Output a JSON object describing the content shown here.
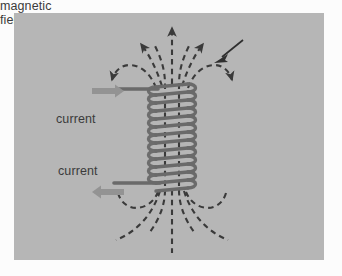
{
  "figure": {
    "background_color": "#b6b6b6",
    "page_color": "#fcfcfc",
    "ink_color": "#6a6a6a",
    "text_color": "#3b3b3b",
    "arrow_color": "#8e8e8e",
    "dash_color": "#3a3a3a"
  },
  "labels": {
    "current_top": "current",
    "current_bottom": "current",
    "field_lines_line1": "magnetic",
    "field_lines_line2": "field lines"
  },
  "components": {
    "solenoid": {
      "name": "helical coil",
      "turns": 13,
      "left": 152,
      "right": 192,
      "top": 84,
      "bottom": 190
    },
    "lead_top": {
      "y": 89,
      "from_x": 118,
      "to_x": 156
    },
    "lead_bottom": {
      "y": 183,
      "from_x": 114,
      "to_x": 158
    },
    "current_arrow_top": {
      "direction": "right",
      "x": 97,
      "y": 91
    },
    "current_arrow_bottom": {
      "direction": "left",
      "x": 98,
      "y": 192
    }
  },
  "field_lines": {
    "type": "dashed",
    "description": "magnetic field lines emerging from the top of the solenoid, looping outward and re-entering at the bottom",
    "count": 7,
    "arrow_heads": 5
  }
}
